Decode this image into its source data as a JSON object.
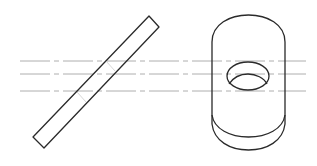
{
  "diagram": {
    "type": "technical-drawing",
    "views": [
      {
        "name": "inclined-rod",
        "description": "Inclined rectangular bar (side view)"
      },
      {
        "name": "cylinder-with-hole",
        "description": "Upright cylinder with cross hole (isometric view)"
      }
    ],
    "centerlines": {
      "count": 3,
      "y": [
        61,
        74,
        91
      ],
      "style": "dash-dot"
    },
    "colors": {
      "outline": "#2a2a2a",
      "centerline": "#9a9a9a",
      "background": "#ffffff"
    }
  }
}
